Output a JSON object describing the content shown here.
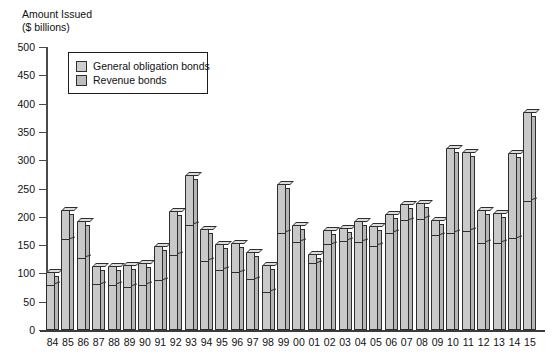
{
  "axis_title_line1": "Amount Issued",
  "axis_title_line2": "($ billions)",
  "legend": {
    "items": [
      {
        "label": "General obligation bonds",
        "color": "#cdcdcd",
        "icon": "legend-swatch-icon"
      },
      {
        "label": "Revenue bonds",
        "color": "#bdbdbd",
        "icon": "legend-swatch-icon"
      }
    ]
  },
  "chart_data": {
    "type": "bar",
    "stacked": true,
    "xlabel": "",
    "ylabel": "Amount Issued ($ billions)",
    "ylim": [
      0,
      500
    ],
    "yticks": [
      0,
      50,
      100,
      150,
      200,
      250,
      300,
      350,
      400,
      450,
      500
    ],
    "ytick_labels": [
      "0",
      "50",
      "100",
      "150",
      "200",
      "250",
      "300",
      "350",
      "400",
      "450",
      "500"
    ],
    "grid": false,
    "legend_position": "upper-left-inset",
    "categories": [
      "84",
      "85",
      "86",
      "87",
      "88",
      "89",
      "90",
      "91",
      "92",
      "93",
      "94",
      "95",
      "96",
      "97",
      "98",
      "99",
      "00",
      "01",
      "02",
      "03",
      "04",
      "05",
      "06",
      "07",
      "08",
      "09",
      "10",
      "11",
      "12",
      "13",
      "14",
      "15"
    ],
    "series": [
      {
        "name": "Revenue bonds",
        "values": [
          78,
          159,
          126,
          79,
          78,
          75,
          78,
          86,
          131,
          184,
          121,
          105,
          100,
          88,
          66,
          170,
          154,
          116,
          150,
          156,
          154,
          147,
          170,
          192,
          195,
          166,
          170,
          174,
          152,
          152,
          160,
          227
        ]
      },
      {
        "name": "General obligation bonds",
        "values": [
          25,
          53,
          67,
          34,
          35,
          39,
          40,
          63,
          80,
          90,
          58,
          47,
          54,
          50,
          48,
          88,
          31,
          19,
          27,
          25,
          39,
          37,
          35,
          30,
          29,
          29,
          152,
          141,
          60,
          55,
          153,
          158
        ]
      }
    ],
    "totals": [
      103,
      212,
      193,
      113,
      113,
      114,
      118,
      149,
      211,
      274,
      179,
      152,
      154,
      138,
      114,
      258,
      185,
      135,
      177,
      181,
      193,
      184,
      205,
      222,
      224,
      195,
      322,
      315,
      212,
      207,
      313,
      385
    ]
  }
}
